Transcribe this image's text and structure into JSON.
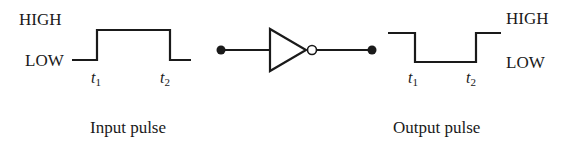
{
  "input_pulse": {
    "high_label": "HIGH",
    "low_label": "LOW",
    "t1_label": "t",
    "t1_sub": "1",
    "t2_label": "t",
    "t2_sub": "2",
    "caption": "Input pulse"
  },
  "gate": {
    "type": "NOT (inverter)",
    "input_terminal": "input-dot",
    "output_terminal": "output-dot"
  },
  "output_pulse": {
    "high_label": "HIGH",
    "low_label": "LOW",
    "t1_label": "t",
    "t1_sub": "1",
    "t2_label": "t",
    "t2_sub": "2",
    "caption": "Output pulse"
  },
  "colors": {
    "ink": "#1a1a1a",
    "background": "#ffffff"
  }
}
